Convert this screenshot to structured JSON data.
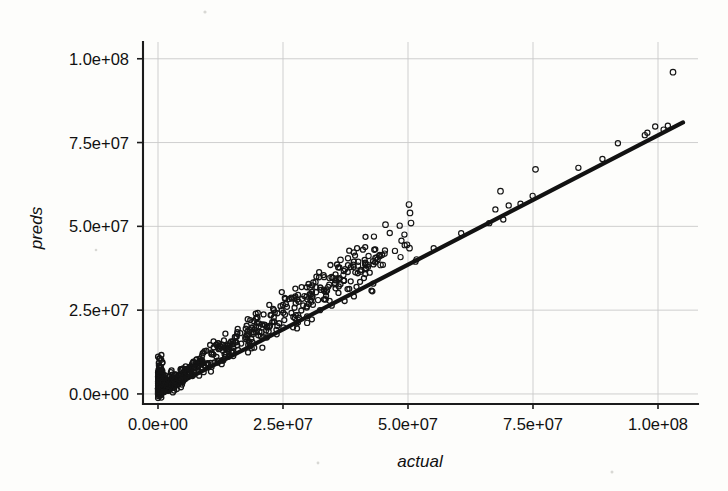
{
  "figure": {
    "background_color": "#fdfdfb",
    "ink_color": "#141414",
    "grid_color": "#c9c9c9",
    "plot_box": {
      "left": 143,
      "right": 698,
      "top": 42,
      "bottom": 404
    }
  },
  "chart_data": {
    "type": "scatter",
    "title": "",
    "xlabel": "actual",
    "ylabel": "preds",
    "xlim": [
      -3000000,
      108000000
    ],
    "ylim": [
      -3000000,
      105000000
    ],
    "grid": true,
    "legend": "none",
    "xticks": [
      0,
      25000000,
      50000000,
      75000000,
      100000000
    ],
    "xtick_labels": [
      "0.0e+00",
      "2.5e+07",
      "5.0e+07",
      "7.5e+07",
      "1.0e+08"
    ],
    "yticks": [
      0,
      25000000,
      50000000,
      75000000,
      100000000
    ],
    "ytick_labels": [
      "0.0e+00",
      "2.5e+07",
      "5.0e+07",
      "7.5e+07",
      "1.0e+08"
    ],
    "marker": "open-circle",
    "marker_size_px": 5,
    "reference_line": {
      "label": "identity / fit line",
      "x": [
        0,
        105000000
      ],
      "y": [
        0,
        81000000
      ],
      "width_px": 4.2,
      "color": "#121212"
    },
    "series": [
      {
        "name": "predictions vs actual",
        "n_points_drawn": 760,
        "description": "Dense elongated cloud rising from the origin along the diagonal; thick near 0-3e7 then thinning, with a handful of high outliers above the line between 3.5e7 and 7.5e7 and one extreme point near (1.03e8, 9.6e7).",
        "outliers": [
          {
            "x": 103000000,
            "y": 96000000
          },
          {
            "x": 75500000,
            "y": 67000000
          },
          {
            "x": 68500000,
            "y": 60500000
          },
          {
            "x": 50200000,
            "y": 56500000
          },
          {
            "x": 50400000,
            "y": 54000000
          },
          {
            "x": 50600000,
            "y": 51000000
          },
          {
            "x": 45500000,
            "y": 50500000
          },
          {
            "x": 49800000,
            "y": 44500000
          },
          {
            "x": 50300000,
            "y": 43500000
          },
          {
            "x": 43500000,
            "y": 40500000
          },
          {
            "x": 44500000,
            "y": 38500000
          },
          {
            "x": 40500000,
            "y": 36500000
          },
          {
            "x": 36500000,
            "y": 40000000
          }
        ]
      }
    ]
  }
}
